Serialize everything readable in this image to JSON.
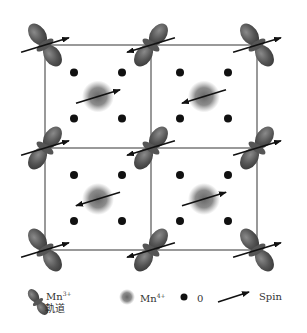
{
  "diagram": {
    "colors": {
      "grid": "#777777",
      "lobe": "#555555",
      "dot": "#111111",
      "blob": "#666666",
      "arrow": "#111111"
    },
    "mn3_sites": [
      {
        "col": 0,
        "row": 0,
        "orient": "a",
        "spin": "right"
      },
      {
        "col": 1,
        "row": 0,
        "orient": "b",
        "spin": "left"
      },
      {
        "col": 2,
        "row": 0,
        "orient": "a",
        "spin": "right"
      },
      {
        "col": 0,
        "row": 1,
        "orient": "b",
        "spin": "right"
      },
      {
        "col": 1,
        "row": 1,
        "orient": "b",
        "spin": "left"
      },
      {
        "col": 2,
        "row": 1,
        "orient": "b",
        "spin": "right"
      },
      {
        "col": 0,
        "row": 2,
        "orient": "a",
        "spin": "right"
      },
      {
        "col": 1,
        "row": 2,
        "orient": "b",
        "spin": "left"
      },
      {
        "col": 2,
        "row": 2,
        "orient": "a",
        "spin": "right"
      }
    ],
    "mn4_sites": [
      {
        "col": 0,
        "row": 0,
        "spin": "right"
      },
      {
        "col": 1,
        "row": 0,
        "spin": "left"
      },
      {
        "col": 0,
        "row": 1,
        "spin": "left"
      },
      {
        "col": 1,
        "row": 1,
        "spin": "right"
      }
    ]
  },
  "legend": {
    "mn3_label": "Mn",
    "mn3_charge": "3+",
    "mn3_sub": "軌道",
    "mn4_label": "Mn",
    "mn4_charge": "4+",
    "o_label": "0",
    "spin_label": "Spin"
  }
}
